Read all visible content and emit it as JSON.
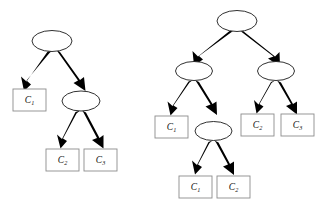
{
  "figure": {
    "background_color": "#ffffff",
    "node_outline_color": "#1a1a1a",
    "leaf_border_color": "#8c8c8c",
    "edge_color": "#000000",
    "label_color": "#111111"
  },
  "trees": [
    {
      "id": "left-tree",
      "name": "left-decision-tree",
      "root": {
        "name": "root-node",
        "shape": "ellipse",
        "label": ""
      },
      "internal_nodes": [
        {
          "name": "internal-node-1",
          "shape": "ellipse",
          "label": ""
        }
      ],
      "leaves": [
        {
          "name": "leaf-c1",
          "base": "C",
          "sub": "1",
          "text": "C1"
        },
        {
          "name": "leaf-c2",
          "base": "C",
          "sub": "2",
          "text": "C2"
        },
        {
          "name": "leaf-c3",
          "base": "C",
          "sub": "3",
          "text": "C3"
        }
      ],
      "edge_count": 4
    },
    {
      "id": "right-tree",
      "name": "right-decision-tree",
      "root": {
        "name": "root-node",
        "shape": "ellipse",
        "label": ""
      },
      "internal_nodes": [
        {
          "name": "internal-node-left",
          "shape": "ellipse",
          "label": ""
        },
        {
          "name": "internal-node-right",
          "shape": "ellipse",
          "label": ""
        },
        {
          "name": "internal-node-lower",
          "shape": "ellipse",
          "label": ""
        }
      ],
      "leaves": [
        {
          "name": "leaf-c1-left",
          "base": "C",
          "sub": "1",
          "text": "C1"
        },
        {
          "name": "leaf-c2-right",
          "base": "C",
          "sub": "2",
          "text": "C2"
        },
        {
          "name": "leaf-c3-right",
          "base": "C",
          "sub": "3",
          "text": "C3"
        },
        {
          "name": "leaf-c1-bottom",
          "base": "C",
          "sub": "1",
          "text": "C1"
        },
        {
          "name": "leaf-c2-bottom",
          "base": "C",
          "sub": "2",
          "text": "C2"
        }
      ],
      "edge_count": 8
    }
  ],
  "labels": {
    "left": {
      "c1": "C",
      "c1_sub": "1",
      "c2": "C",
      "c2_sub": "2",
      "c3": "C",
      "c3_sub": "3"
    },
    "right": {
      "c1": "C",
      "c1_sub": "1",
      "c2": "C",
      "c2_sub": "2",
      "c3": "C",
      "c3_sub": "3",
      "c1b": "C",
      "c1b_sub": "1",
      "c2b": "C",
      "c2b_sub": "2"
    }
  }
}
